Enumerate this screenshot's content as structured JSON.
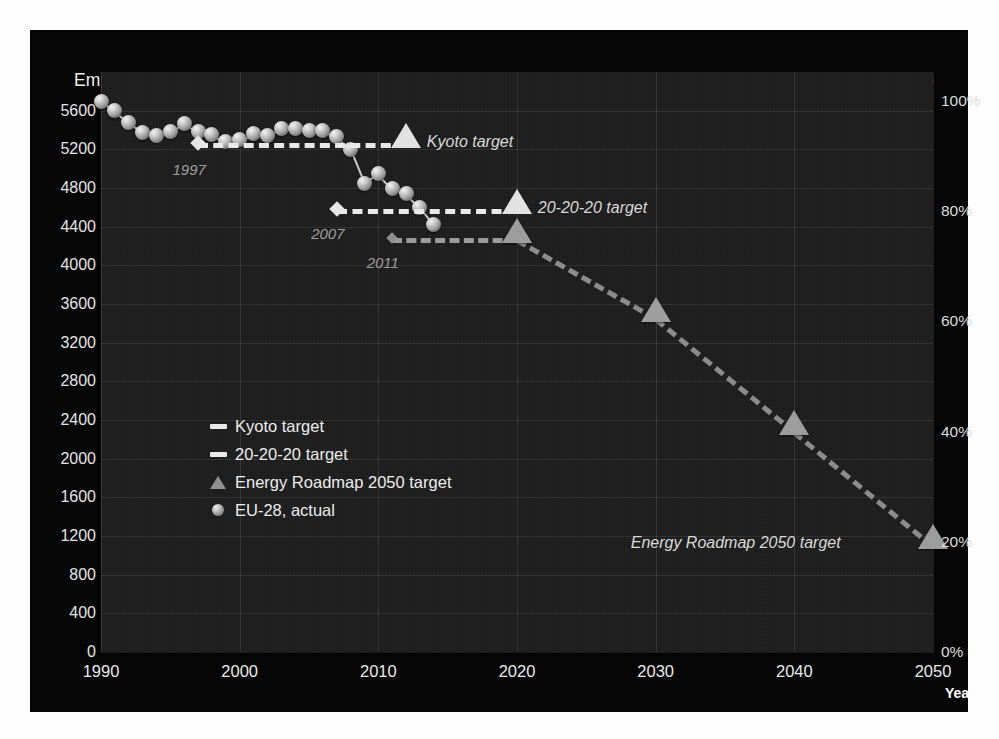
{
  "chart_data": {
    "type": "line",
    "title": "Emission (million tonnes CO2 equivalent)",
    "title_main": "Emission (million tonnes CO",
    "title_sub": "2",
    "title_tail": " equivalent)",
    "right_axis_title": "Emission (1990: 100%)",
    "xlabel": "Year",
    "ylabel": "Emission (million tonnes CO2 equivalent)",
    "xlim": [
      1990,
      2050
    ],
    "ylim": [
      0,
      6000
    ],
    "y_ticks": [
      "5600",
      "5200",
      "4800",
      "4400",
      "4000",
      "3600",
      "3200",
      "2800",
      "2400",
      "2000",
      "1600",
      "1200",
      "800",
      "400",
      "0"
    ],
    "y_tick_values": [
      5600,
      5200,
      4800,
      4400,
      4000,
      3600,
      3200,
      2800,
      2400,
      2000,
      1600,
      1200,
      800,
      400,
      0
    ],
    "x_ticks": [
      "1990",
      "2000",
      "2010",
      "2020",
      "2030",
      "2040",
      "2050"
    ],
    "x_tick_values": [
      1990,
      2000,
      2010,
      2020,
      2030,
      2040,
      2050
    ],
    "secondary_y_ticks": [
      "100%",
      "80%",
      "60%",
      "40%",
      "20%",
      "0%"
    ],
    "secondary_y_tick_values": [
      100,
      80,
      60,
      40,
      20,
      0
    ],
    "secondary_y_basis": 5700,
    "grid": true,
    "legend_position": "inside-left",
    "series": [
      {
        "name": "EU-28, actual",
        "marker": "sphere",
        "x": [
          1990,
          1991,
          1992,
          1993,
          1994,
          1995,
          1996,
          1997,
          1998,
          1999,
          2000,
          2001,
          2002,
          2003,
          2004,
          2005,
          2006,
          2007,
          2008,
          2009,
          2010,
          2011,
          2012,
          2013,
          2014
        ],
        "values": [
          5700,
          5600,
          5480,
          5370,
          5340,
          5380,
          5470,
          5380,
          5350,
          5280,
          5300,
          5360,
          5340,
          5420,
          5420,
          5390,
          5390,
          5330,
          5200,
          4850,
          4950,
          4800,
          4740,
          4600,
          4420
        ]
      },
      {
        "name": "Kyoto target",
        "marker": "triangle",
        "style": "dashed",
        "x": [
          1997,
          2012
        ],
        "values": [
          5270,
          5270
        ],
        "target_year": 2012,
        "target_value": 5270,
        "base_year": 1997
      },
      {
        "name": "20-20-20 target",
        "marker": "triangle",
        "style": "dashed",
        "x": [
          2007,
          2020
        ],
        "values": [
          4580,
          4580
        ],
        "target_year": 2020,
        "target_value": 4580,
        "base_year": 2007
      },
      {
        "name": "Energy Roadmap 2050 target",
        "marker": "triangle",
        "style": "dashed",
        "x": [
          2011,
          2020,
          2030,
          2040,
          2050
        ],
        "values": [
          4280,
          4280,
          3470,
          2300,
          1120
        ],
        "base_year": 2011
      }
    ],
    "annotations": [
      {
        "text": "Kyoto target",
        "x": 2013.5,
        "y": 5270
      },
      {
        "text": "20-20-20 target",
        "x": 2021.5,
        "y": 4580
      },
      {
        "text": "Energy Roadmap 2050 target",
        "x": 2040,
        "y": 1120
      },
      {
        "text": "1997",
        "x": 1996.6,
        "y": 5000
      },
      {
        "text": "2007",
        "x": 2006.6,
        "y": 4330
      },
      {
        "text": "2011",
        "x": 2010.6,
        "y": 4030
      }
    ],
    "legend": [
      {
        "label": "Kyoto target",
        "marker": "dash"
      },
      {
        "label": "20-20-20 target",
        "marker": "dash"
      },
      {
        "label": "Energy Roadmap 2050 target",
        "marker": "triangle"
      },
      {
        "label": "EU-28, actual",
        "marker": "circle"
      }
    ],
    "colors": {
      "frame_background": "#050505",
      "plot_background": "#1d1d1d",
      "gridline": "#3a3a3a",
      "text": "#ececec",
      "marker_sphere": "#c9c9c9",
      "marker_triangle": "#9d9d9d",
      "dashline": "#e9e9e9",
      "roadmap_line": "#8c8c8c",
      "annotation_text": "#d9d9d9"
    }
  }
}
